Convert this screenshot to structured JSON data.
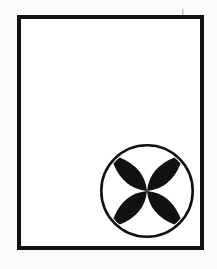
{
  "artwork": {
    "title": "Framed quatrefoil rosette",
    "description": "A thick black rectangular frame drawn on an off-white ground, enclosing a large empty field. In the lower-right quadrant sits a thin outlined circle containing a solid black four-petal rosette whose lobes radiate along the diagonals and meet at a narrow waist in the centre.",
    "medium": "line drawing",
    "palette": {
      "ink": "#111111",
      "ground": "#fbfbfa",
      "frame_fill": "#ffffff",
      "petal_fill": "#111111",
      "ring_stroke": "#111111"
    },
    "canvas": {
      "width": 217,
      "height": 269
    },
    "frame": {
      "name": "outer rectangular border",
      "x": 17,
      "y": 15,
      "width": 187,
      "height": 235,
      "stroke_width": 4
    },
    "rosette": {
      "name": "circled four-petal rosette",
      "center_x": 147,
      "center_y": 191,
      "ring_radius": 47,
      "ring_stroke_width": 2.6,
      "petal_count": 4,
      "petal_length": 43,
      "petal_half_width": 15,
      "petal_angles_degrees": [
        45,
        135,
        225,
        315
      ],
      "orientation": "diagonal / saltire"
    },
    "stray_mark": {
      "name": "faint tick mark above frame",
      "x": 182,
      "y": 9,
      "width": 1.4,
      "height": 6,
      "opacity": 0.28
    }
  }
}
